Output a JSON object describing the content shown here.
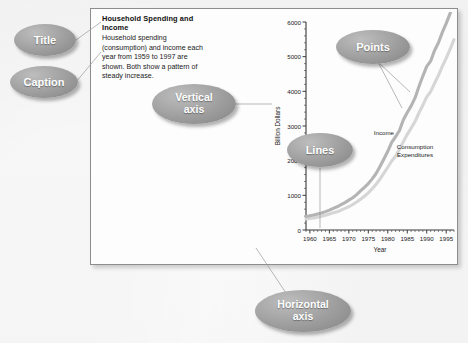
{
  "panel": {
    "title": "Household Spending and Income",
    "caption": "Household spending (consumption) and income each year from 1959 to 1997 are shown. Both show a pattern of steady increase."
  },
  "callouts": [
    {
      "id": "title",
      "label": "Title"
    },
    {
      "id": "caption",
      "label": "Caption"
    },
    {
      "id": "vertical-axis",
      "line1": "Vertical",
      "line2": "axis"
    },
    {
      "id": "lines",
      "label": "Lines"
    },
    {
      "id": "points",
      "label": "Points"
    },
    {
      "id": "horizontal-axis",
      "line1": "Horizontal",
      "line2": "axis"
    }
  ],
  "chart_data": {
    "type": "line",
    "title": "",
    "xlabel": "Year",
    "ylabel": "Billion Dollars",
    "xlim": [
      1959,
      1997
    ],
    "ylim": [
      0,
      6000
    ],
    "xticks": [
      1960,
      1965,
      1970,
      1975,
      1980,
      1985,
      1990,
      1995
    ],
    "xtick_labels": [
      "1960",
      "1965",
      "1970",
      "1975",
      "1980",
      "1985",
      "1990",
      "1995"
    ],
    "yticks": [
      0,
      1000,
      2000,
      3000,
      4000,
      5000,
      6000
    ],
    "ytick_labels": [
      "0",
      "1000",
      "2000",
      "3000",
      "4000",
      "5000",
      "6000"
    ],
    "minor_ticks": true,
    "grid": false,
    "legend": "inline-labels",
    "x": [
      1959,
      1960,
      1961,
      1962,
      1963,
      1964,
      1965,
      1966,
      1967,
      1968,
      1969,
      1970,
      1971,
      1972,
      1973,
      1974,
      1975,
      1976,
      1977,
      1978,
      1979,
      1980,
      1981,
      1982,
      1983,
      1984,
      1985,
      1986,
      1987,
      1988,
      1989,
      1990,
      1991,
      1992,
      1993,
      1994,
      1995,
      1996,
      1997
    ],
    "series": [
      {
        "name": "Income",
        "color": "#b4b4b4",
        "values": [
          390,
          410,
          430,
          460,
          490,
          530,
          575,
          625,
          670,
          730,
          790,
          860,
          930,
          1020,
          1130,
          1230,
          1340,
          1475,
          1630,
          1830,
          2050,
          2270,
          2530,
          2690,
          2870,
          3180,
          3390,
          3580,
          3810,
          4140,
          4440,
          4720,
          4870,
          5180,
          5400,
          5700,
          5960,
          6250,
          6600
        ]
      },
      {
        "name": "Consumption Expenditures",
        "color": "#d6d6d6",
        "values": [
          320,
          335,
          345,
          370,
          395,
          425,
          460,
          495,
          525,
          575,
          625,
          670,
          735,
          810,
          890,
          975,
          1070,
          1190,
          1320,
          1470,
          1640,
          1810,
          1990,
          2130,
          2330,
          2550,
          2760,
          2940,
          3130,
          3380,
          3600,
          3840,
          3990,
          4230,
          4460,
          4720,
          4960,
          5220,
          5490
        ]
      }
    ],
    "annotations": [
      {
        "text": "Income",
        "x": 1979,
        "y": 2750
      },
      {
        "text": "Consumption Expenditures",
        "x": 1987,
        "y": 2350
      }
    ]
  }
}
